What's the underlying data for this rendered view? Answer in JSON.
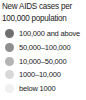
{
  "legend": {
    "title_line1": "New AIDS cases per",
    "title_line2": "100,000 population",
    "items": [
      {
        "label": "100,000 and above",
        "color": "#6f6f6f",
        "swatch_icon": "circle-swatch-icon"
      },
      {
        "label": "50,000–100,000",
        "color": "#8f8f8f",
        "swatch_icon": "circle-swatch-icon"
      },
      {
        "label": "10,000–50,000",
        "color": "#b4b4b4",
        "swatch_icon": "circle-swatch-icon"
      },
      {
        "label": "1000–10,000",
        "color": "#d8d8d8",
        "swatch_icon": "circle-swatch-icon"
      },
      {
        "label": "below 1000",
        "color": "#f0f0f0",
        "swatch_icon": "circle-swatch-icon"
      }
    ]
  },
  "chart_data": {
    "type": "table",
    "title": "New AIDS cases per 100,000 population",
    "categories": [
      "100,000 and above",
      "50,000–100,000",
      "10,000–50,000",
      "1000–10,000",
      "below 1000"
    ],
    "values": [
      100000,
      75000,
      30000,
      5500,
      500
    ],
    "bin_edges": [
      0,
      1000,
      10000,
      50000,
      100000
    ],
    "colors": [
      "#6f6f6f",
      "#8f8f8f",
      "#b4b4b4",
      "#d8d8d8",
      "#f0f0f0"
    ],
    "xlabel": "",
    "ylabel": "New AIDS cases per 100,000 population",
    "legend_position": "standalone",
    "grid": false
  }
}
